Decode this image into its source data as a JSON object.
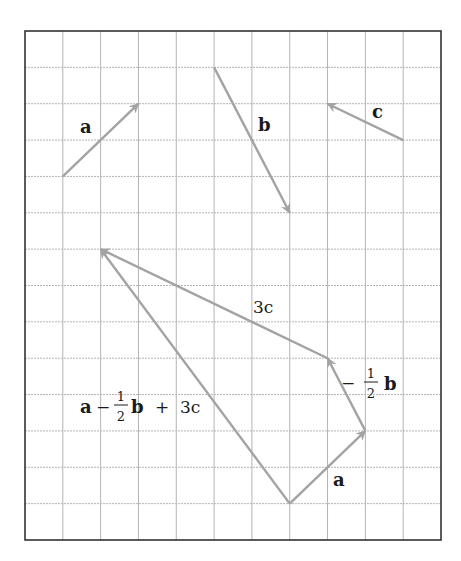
{
  "diagram": {
    "type": "vector-addition-grid",
    "grid": {
      "columns": 11,
      "rows": 14,
      "left": 25,
      "top": 31,
      "right": 441,
      "bottom": 540,
      "line_color": "#b4b4b4",
      "frame_color": "#333333"
    },
    "arrow_color": "#a3a3a3",
    "vectors": [
      {
        "id": "a",
        "label": "a",
        "from": [
          1,
          4
        ],
        "to": [
          3,
          2
        ],
        "components": [
          2,
          2
        ]
      },
      {
        "id": "b",
        "label": "b",
        "from": [
          5,
          1
        ],
        "to": [
          7,
          5
        ],
        "components": [
          2,
          -4
        ]
      },
      {
        "id": "c",
        "label": "c",
        "from": [
          10,
          3
        ],
        "to": [
          8,
          2
        ],
        "components": [
          -2,
          1
        ]
      },
      {
        "id": "a2",
        "label": "a",
        "from": [
          7,
          13
        ],
        "to": [
          9,
          11
        ],
        "components": [
          2,
          2
        ]
      },
      {
        "id": "neg-half-b",
        "label": "−½b",
        "from": [
          9,
          11
        ],
        "to": [
          8,
          9
        ],
        "components": [
          -1,
          2
        ]
      },
      {
        "id": "3c",
        "label": "3c",
        "from": [
          8,
          9
        ],
        "to": [
          2,
          6
        ],
        "components": [
          -6,
          3
        ]
      },
      {
        "id": "resultant",
        "label": "a − ½b + 3c",
        "from": [
          7,
          13
        ],
        "to": [
          2,
          6
        ],
        "components": [
          -5,
          7
        ]
      }
    ],
    "labels": {
      "a_top": "a",
      "b_top": "b",
      "c_top": "c",
      "three_c": "3c",
      "neg_half_b": {
        "sign": "−",
        "num": "1",
        "den": "2",
        "var": "b"
      },
      "a_bottom": "a",
      "resultant": {
        "a": "a",
        "minus": "−",
        "num": "1",
        "den": "2",
        "b": "b",
        "plus": "+",
        "three_c": "3c"
      }
    }
  }
}
